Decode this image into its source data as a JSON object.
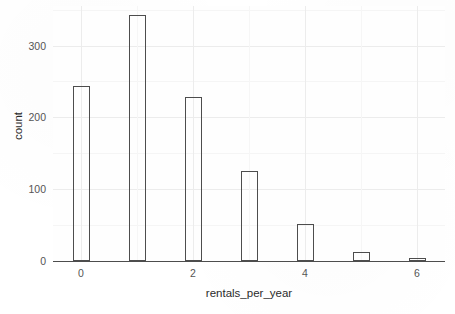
{
  "chart_data": {
    "type": "bar",
    "title": "",
    "subtitle": "",
    "xlabel": "rentals_per_year",
    "ylabel": "count",
    "categories": [
      "0",
      "1",
      "2",
      "3",
      "4",
      "5",
      "6"
    ],
    "x": [
      0,
      1,
      2,
      3,
      4,
      5,
      6
    ],
    "values": [
      244,
      343,
      228,
      125,
      51,
      12,
      4
    ],
    "xlim": [
      -0.5,
      6.5
    ],
    "ylim": [
      0,
      355
    ],
    "xticks": [
      0,
      2,
      4,
      6
    ],
    "xtick_labels": [
      "0",
      "2",
      "4",
      "6"
    ],
    "yticks": [
      0,
      100,
      200,
      300
    ],
    "ytick_labels": [
      "0",
      "100",
      "200",
      "300"
    ],
    "y_minor_ticks": [
      50,
      150,
      250,
      350
    ],
    "x_minor_ticks": [
      1,
      3,
      5
    ],
    "grid": true,
    "legend": null,
    "bar_fill": "none",
    "bar_outline_color": "#4d4d4d",
    "panel_background": "#fefefe",
    "grid_major_color": "#ececec",
    "grid_minor_color": "#f5f5f5",
    "axis_text_color": "#555555",
    "axis_title_color": "#2b2b2b"
  }
}
